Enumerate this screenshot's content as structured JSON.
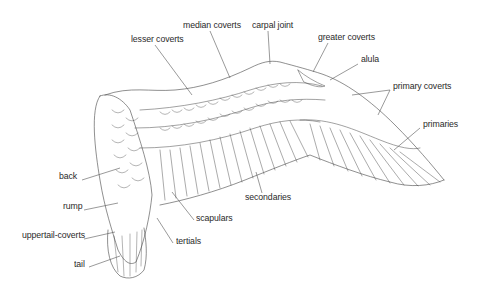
{
  "diagram": {
    "colors": {
      "ink": "#2a2a2a",
      "line": "#444444",
      "leader": "#555555",
      "background": "#ffffff"
    },
    "labels": [
      {
        "id": "median-coverts",
        "text": "median coverts",
        "x": 183,
        "y": 24
      },
      {
        "id": "carpal-joint",
        "text": "carpal joint",
        "x": 252,
        "y": 24
      },
      {
        "id": "lesser-coverts",
        "text": "lesser coverts",
        "x": 131,
        "y": 38
      },
      {
        "id": "greater-coverts",
        "text": "greater coverts",
        "x": 318,
        "y": 36
      },
      {
        "id": "alula",
        "text": "alula",
        "x": 361,
        "y": 58
      },
      {
        "id": "primary-coverts",
        "text": "primary coverts",
        "x": 393,
        "y": 85
      },
      {
        "id": "primaries",
        "text": "primaries",
        "x": 423,
        "y": 123
      },
      {
        "id": "secondaries",
        "text": "secondaries",
        "x": 245,
        "y": 196
      },
      {
        "id": "back",
        "text": "back",
        "x": 59,
        "y": 175
      },
      {
        "id": "rump",
        "text": "rump",
        "x": 63,
        "y": 205
      },
      {
        "id": "scapulars",
        "text": "scapulars",
        "x": 196,
        "y": 217
      },
      {
        "id": "uppertail-coverts",
        "text": "uppertail-coverts",
        "x": 22,
        "y": 234
      },
      {
        "id": "tertials",
        "text": "tertials",
        "x": 176,
        "y": 240
      },
      {
        "id": "tail",
        "text": "tail",
        "x": 74,
        "y": 263
      }
    ]
  }
}
